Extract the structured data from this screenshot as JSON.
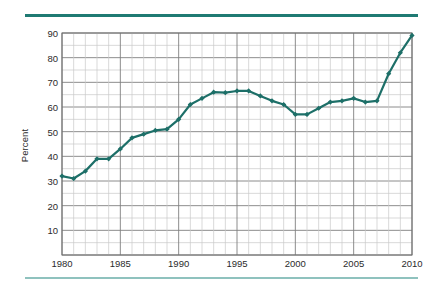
{
  "figure": {
    "top_rule_color": "#1f7a73",
    "bottom_rule_color": "#8fc2be",
    "background": "#ffffff"
  },
  "chart_data": {
    "type": "line",
    "title": "",
    "subtitle": "",
    "xlabel": "",
    "ylabel": "Percent",
    "xlim": [
      1980,
      2010
    ],
    "ylim": [
      0,
      90
    ],
    "grid": true,
    "legend": null,
    "line_color": "#1d6f68",
    "marker": "diamond",
    "x_ticks": [
      1980,
      1985,
      1990,
      1995,
      2000,
      2005,
      2010
    ],
    "y_ticks": [
      10,
      20,
      30,
      40,
      50,
      60,
      70,
      80,
      90
    ],
    "x_minor_step": 1,
    "y_minor_step": 5,
    "x": [
      1980,
      1981,
      1982,
      1983,
      1984,
      1985,
      1986,
      1987,
      1988,
      1989,
      1990,
      1991,
      1992,
      1993,
      1994,
      1995,
      1996,
      1997,
      1998,
      1999,
      2000,
      2001,
      2002,
      2003,
      2004,
      2005,
      2006,
      2007,
      2008,
      2009,
      2010
    ],
    "values": [
      32,
      31,
      34,
      39,
      39,
      43,
      47.5,
      49,
      50.5,
      51,
      55,
      61,
      63.5,
      66,
      65.8,
      66.5,
      66.5,
      64.5,
      62.5,
      61,
      57,
      57,
      59.5,
      62,
      62.5,
      63.5,
      62,
      62.5,
      73.5,
      82,
      89
    ],
    "series": [
      {
        "name": "Percent",
        "values": [
          32,
          31,
          34,
          39,
          39,
          43,
          47.5,
          49,
          50.5,
          51,
          55,
          61,
          63.5,
          66,
          65.8,
          66.5,
          66.5,
          64.5,
          62.5,
          61,
          57,
          57,
          59.5,
          62,
          62.5,
          63.5,
          62,
          62.5,
          73.5,
          82,
          89
        ]
      }
    ]
  },
  "axis": {
    "y_title": "Percent",
    "y_tick_labels": [
      "90",
      "80",
      "70",
      "60",
      "50",
      "40",
      "30",
      "20",
      "10"
    ],
    "x_tick_labels": [
      "1980",
      "1985",
      "1990",
      "1995",
      "2000",
      "2005",
      "2010"
    ]
  }
}
